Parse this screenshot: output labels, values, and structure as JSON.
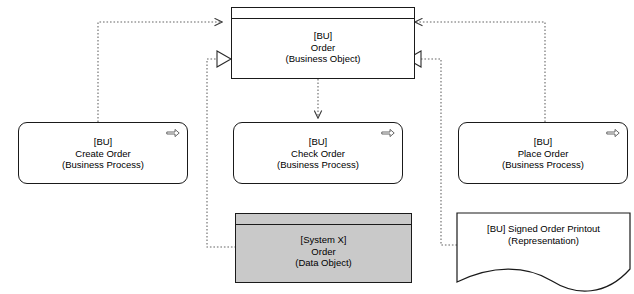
{
  "diagram": {
    "colors": {
      "stroke": "#1a1a1a",
      "fill": "#ffffff",
      "shaded_fill": "#c9c9c9",
      "connector": "#555555"
    },
    "nodes": [
      {
        "id": "order-business-object",
        "shape": "object",
        "shaded": false,
        "line1": "[BU]",
        "line2": "Order",
        "line3": "(Business Object)",
        "icon": ""
      },
      {
        "id": "create-order",
        "shape": "process",
        "shaded": false,
        "line1": "[BU]",
        "line2": "Create Order",
        "line3": "(Business Process)",
        "icon": "process-arrow-icon"
      },
      {
        "id": "check-order",
        "shape": "process",
        "shaded": false,
        "line1": "[BU]",
        "line2": "Check Order",
        "line3": "(Business Process)",
        "icon": "process-arrow-icon"
      },
      {
        "id": "place-order",
        "shape": "process",
        "shaded": false,
        "line1": "[BU]",
        "line2": "Place Order",
        "line3": "(Business Process)",
        "icon": "process-arrow-icon"
      },
      {
        "id": "system-x-order",
        "shape": "object",
        "shaded": true,
        "line1": "[System X]",
        "line2": "Order",
        "line3": "(Data Object)",
        "icon": ""
      },
      {
        "id": "signed-order-printout",
        "shape": "representation",
        "shaded": false,
        "line1": "[BU] Signed Order Printout",
        "line2": "(Representation)",
        "line3": "",
        "icon": ""
      }
    ],
    "connectors": [
      {
        "id": "create-order-to-order",
        "from": "create-order",
        "to": "order-business-object",
        "style": "dotted",
        "arrow": "open-arrow"
      },
      {
        "id": "place-order-to-order",
        "from": "place-order",
        "to": "order-business-object",
        "style": "dotted",
        "arrow": "open-arrow"
      },
      {
        "id": "order-to-check-order",
        "from": "order-business-object",
        "to": "check-order",
        "style": "dotted",
        "arrow": "open-arrow"
      },
      {
        "id": "system-x-order-realizes-order",
        "from": "system-x-order",
        "to": "order-business-object",
        "style": "dotted",
        "arrow": "hollow-triangle"
      },
      {
        "id": "signed-order-printout-realizes-order",
        "from": "signed-order-printout",
        "to": "order-business-object",
        "style": "dotted",
        "arrow": "hollow-triangle"
      }
    ]
  }
}
